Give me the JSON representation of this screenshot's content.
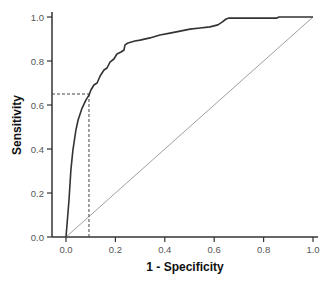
{
  "chart_data": {
    "type": "line",
    "title": "",
    "xlabel": "1 - Specificity",
    "ylabel": "Sensitivity",
    "xlim": [
      0.0,
      1.0
    ],
    "ylim": [
      0.0,
      1.0
    ],
    "grid": false,
    "legend": null,
    "x_ticks": [
      "0.0",
      "0.2",
      "0.4",
      "0.6",
      "0.8",
      "1.0"
    ],
    "y_ticks": [
      "0.0",
      "0.2",
      "0.4",
      "0.6",
      "0.8",
      "1.0"
    ],
    "series": [
      {
        "name": "ROC curve",
        "color": "#333333",
        "style": "solid-step",
        "points": [
          [
            0.0,
            0.0
          ],
          [
            0.012,
            0.168
          ],
          [
            0.02,
            0.305
          ],
          [
            0.028,
            0.395
          ],
          [
            0.04,
            0.486
          ],
          [
            0.049,
            0.532
          ],
          [
            0.065,
            0.586
          ],
          [
            0.081,
            0.623
          ],
          [
            0.093,
            0.645
          ],
          [
            0.101,
            0.668
          ],
          [
            0.113,
            0.691
          ],
          [
            0.126,
            0.7
          ],
          [
            0.138,
            0.732
          ],
          [
            0.154,
            0.759
          ],
          [
            0.166,
            0.768
          ],
          [
            0.178,
            0.795
          ],
          [
            0.194,
            0.809
          ],
          [
            0.206,
            0.832
          ],
          [
            0.223,
            0.841
          ],
          [
            0.235,
            0.85
          ],
          [
            0.239,
            0.873
          ],
          [
            0.251,
            0.882
          ],
          [
            0.279,
            0.891
          ],
          [
            0.3,
            0.895
          ],
          [
            0.34,
            0.905
          ],
          [
            0.38,
            0.918
          ],
          [
            0.421,
            0.927
          ],
          [
            0.462,
            0.936
          ],
          [
            0.502,
            0.945
          ],
          [
            0.543,
            0.95
          ],
          [
            0.583,
            0.955
          ],
          [
            0.615,
            0.964
          ],
          [
            0.632,
            0.977
          ],
          [
            0.648,
            0.991
          ],
          [
            0.66,
            0.995
          ],
          [
            0.854,
            0.995
          ],
          [
            0.862,
            1.0
          ],
          [
            1.0,
            1.0
          ]
        ]
      },
      {
        "name": "Reference line",
        "color": "#999999",
        "style": "solid",
        "points": [
          [
            0.0,
            0.0
          ],
          [
            1.0,
            1.0
          ]
        ]
      }
    ],
    "annotations": [
      {
        "type": "dashed-crosshair",
        "x": 0.093,
        "y": 0.65,
        "color": "#444444",
        "description": "Operating point: 1-Specificity ≈ 0.09, Sensitivity ≈ 0.65"
      }
    ]
  },
  "axes": {
    "x_title": "1 - Specificity",
    "y_title": "Sensitivity",
    "x_tick_labels": [
      "0.0",
      "0.2",
      "0.4",
      "0.6",
      "0.8",
      "1.0"
    ],
    "y_tick_labels": [
      "0.0",
      "0.2",
      "0.4",
      "0.6",
      "0.8",
      "1.0"
    ]
  },
  "colors": {
    "axis": "#333333",
    "curve": "#333333",
    "reference": "#a0a0a0",
    "dashed": "#555555"
  }
}
